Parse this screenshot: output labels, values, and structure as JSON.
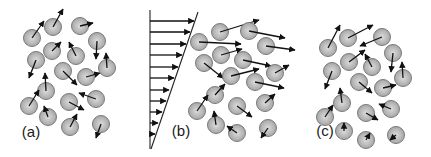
{
  "figure": {
    "colors": {
      "particle_center": "#dcdcdc",
      "particle_edge": "#a6a6a6",
      "particle_stroke": "#7a7a7a",
      "arrow": "#111111",
      "background": "#ffffff"
    },
    "particle_radius": 8.5
  },
  "panels": [
    {
      "id": "a",
      "label": "(a)",
      "label_pos": [
        31,
        137
      ],
      "particles": [
        {
          "c": [
            32,
            38
          ],
          "tip": [
            44,
            21
          ]
        },
        {
          "c": [
            53,
            27
          ],
          "tip": [
            63,
            9
          ]
        },
        {
          "c": [
            80,
            26
          ],
          "tip": [
            93,
            23
          ]
        },
        {
          "c": [
            97,
            41
          ],
          "tip": [
            96,
            59
          ]
        },
        {
          "c": [
            36,
            60
          ],
          "tip": [
            29,
            78
          ]
        },
        {
          "c": [
            52,
            51
          ],
          "tip": [
            61,
            42
          ]
        },
        {
          "c": [
            76,
            56
          ],
          "tip": [
            69,
            42
          ]
        },
        {
          "c": [
            63,
            71
          ],
          "tip": [
            77,
            85
          ]
        },
        {
          "c": [
            86,
            77
          ],
          "tip": [
            100,
            73
          ]
        },
        {
          "c": [
            107,
            68
          ],
          "tip": [
            106,
            53
          ]
        },
        {
          "c": [
            46,
            91
          ],
          "tip": [
            45,
            73
          ]
        },
        {
          "c": [
            29,
            106
          ],
          "tip": [
            39,
            90
          ]
        },
        {
          "c": [
            69,
            102
          ],
          "tip": [
            84,
            110
          ]
        },
        {
          "c": [
            96,
            99
          ],
          "tip": [
            79,
            93
          ]
        },
        {
          "c": [
            48,
            117
          ],
          "tip": [
            44,
            106
          ]
        },
        {
          "c": [
            70,
            127
          ],
          "tip": [
            77,
            114
          ]
        },
        {
          "c": [
            101,
            124
          ],
          "tip": [
            96,
            138
          ]
        }
      ]
    },
    {
      "id": "b",
      "label": "(b)",
      "label_pos": [
        181,
        136
      ],
      "velocity_profile": {
        "wall_x": 150,
        "wall_top": 10,
        "wall_bottom": 149,
        "diag_top": [
          198,
          12
        ],
        "diag_bottom": [
          151,
          149
        ],
        "arrow_rows": [
          {
            "y": 21,
            "tip_x": 194
          },
          {
            "y": 32,
            "tip_x": 190
          },
          {
            "y": 44,
            "tip_x": 186
          },
          {
            "y": 55,
            "tip_x": 182
          },
          {
            "y": 67,
            "tip_x": 178
          },
          {
            "y": 78,
            "tip_x": 174
          },
          {
            "y": 90,
            "tip_x": 169
          },
          {
            "y": 101,
            "tip_x": 166
          },
          {
            "y": 112,
            "tip_x": 162
          },
          {
            "y": 123,
            "tip_x": 158
          },
          {
            "y": 134,
            "tip_x": 155
          }
        ]
      },
      "particles": [
        {
          "c": [
            199,
            42
          ],
          "tip": [
            241,
            44
          ]
        },
        {
          "c": [
            220,
            32
          ],
          "tip": [
            259,
            20
          ]
        },
        {
          "c": [
            249,
            31
          ],
          "tip": [
            285,
            38
          ]
        },
        {
          "c": [
            266,
            46
          ],
          "tip": [
            295,
            50
          ]
        },
        {
          "c": [
            221,
            55
          ],
          "tip": [
            242,
            49
          ]
        },
        {
          "c": [
            204,
            63
          ],
          "tip": [
            223,
            78
          ]
        },
        {
          "c": [
            243,
            60
          ],
          "tip": [
            271,
            66
          ]
        },
        {
          "c": [
            231,
            76
          ],
          "tip": [
            259,
            69
          ]
        },
        {
          "c": [
            255,
            82
          ],
          "tip": [
            284,
            88
          ]
        },
        {
          "c": [
            275,
            73
          ],
          "tip": [
            289,
            65
          ]
        },
        {
          "c": [
            215,
            95
          ],
          "tip": [
            225,
            84
          ]
        },
        {
          "c": [
            197,
            111
          ],
          "tip": [
            208,
            95
          ]
        },
        {
          "c": [
            237,
            106
          ],
          "tip": [
            252,
            117
          ]
        },
        {
          "c": [
            265,
            103
          ],
          "tip": [
            275,
            94
          ]
        },
        {
          "c": [
            216,
            125
          ],
          "tip": [
            214,
            111
          ]
        },
        {
          "c": [
            237,
            133
          ],
          "tip": [
            227,
            126
          ]
        },
        {
          "c": [
            268,
            128
          ],
          "tip": [
            261,
            138
          ]
        }
      ]
    },
    {
      "id": "c",
      "label": "(c)",
      "label_pos": [
        325,
        136
      ],
      "particles": [
        {
          "c": [
            328,
            48
          ],
          "tip": [
            340,
            25
          ]
        },
        {
          "c": [
            348,
            38
          ],
          "tip": [
            373,
            25
          ]
        },
        {
          "c": [
            382,
            37
          ],
          "tip": [
            360,
            46
          ]
        },
        {
          "c": [
            393,
            53
          ],
          "tip": [
            391,
            72
          ]
        },
        {
          "c": [
            349,
            62
          ],
          "tip": [
            365,
            50
          ]
        },
        {
          "c": [
            372,
            67
          ],
          "tip": [
            365,
            54
          ]
        },
        {
          "c": [
            332,
            71
          ],
          "tip": [
            325,
            89
          ]
        },
        {
          "c": [
            359,
            82
          ],
          "tip": [
            372,
            93
          ]
        },
        {
          "c": [
            383,
            88
          ],
          "tip": [
            396,
            85
          ]
        },
        {
          "c": [
            403,
            78
          ],
          "tip": [
            402,
            62
          ]
        },
        {
          "c": [
            342,
            103
          ],
          "tip": [
            340,
            88
          ]
        },
        {
          "c": [
            325,
            117
          ],
          "tip": [
            333,
            105
          ]
        },
        {
          "c": [
            366,
            113
          ],
          "tip": [
            378,
            120
          ]
        },
        {
          "c": [
            391,
            109
          ],
          "tip": [
            379,
            104
          ]
        },
        {
          "c": [
            344,
            131
          ],
          "tip": [
            344,
            123
          ]
        },
        {
          "c": [
            366,
            140
          ],
          "tip": [
            370,
            133
          ]
        },
        {
          "c": [
            396,
            135
          ],
          "tip": [
            390,
            140
          ]
        }
      ]
    }
  ]
}
